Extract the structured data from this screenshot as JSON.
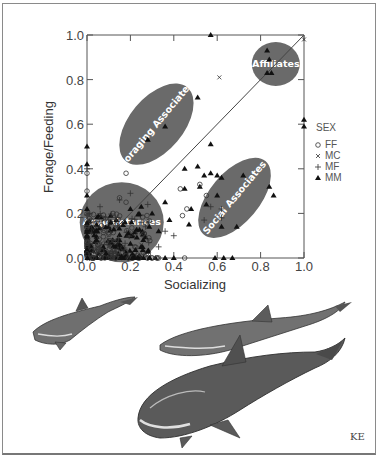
{
  "chart_data": {
    "type": "scatter",
    "title": "",
    "xlabel": "Socializing",
    "ylabel": "Forage/Feeding",
    "xlim": [
      0.0,
      1.0
    ],
    "ylim": [
      0.0,
      1.0
    ],
    "x_ticks": [
      "0.0",
      "0.2",
      "0.4",
      "0.6",
      "0.8",
      "1.0"
    ],
    "y_ticks": [
      "0.0",
      "0.2",
      "0.4",
      "0.6",
      "0.8",
      "1.0"
    ],
    "grid": false,
    "diagonal_reference_line": true,
    "legend": {
      "title": "SEX",
      "position": "right",
      "entries": [
        {
          "symbol": "circle-open",
          "label": "FF"
        },
        {
          "symbol": "x",
          "label": "MC"
        },
        {
          "symbol": "plus",
          "label": "MF"
        },
        {
          "symbol": "triangle-filled",
          "label": "MM"
        }
      ]
    },
    "regions": [
      {
        "label": "Affiliates",
        "center": [
          0.87,
          0.87
        ],
        "shape": "circle"
      },
      {
        "label": "Foraging Associates",
        "center": [
          0.32,
          0.6
        ],
        "shape": "ellipse"
      },
      {
        "label": "Social Associates",
        "center": [
          0.68,
          0.27
        ],
        "shape": "ellipse"
      },
      {
        "label": "Acquaintances",
        "center": [
          0.16,
          0.16
        ],
        "shape": "circle"
      }
    ],
    "series": [
      {
        "name": "MM",
        "points": [
          [
            0.0,
            0.5
          ],
          [
            0.0,
            0.42
          ],
          [
            0.0,
            0.28
          ],
          [
            0.0,
            0.22
          ],
          [
            0.28,
            0.53
          ],
          [
            0.36,
            0.59
          ],
          [
            0.57,
            1.0
          ],
          [
            0.51,
            0.72
          ],
          [
            0.83,
            0.93
          ],
          [
            0.84,
            0.89
          ],
          [
            0.83,
            0.83
          ],
          [
            0.85,
            0.83
          ],
          [
            0.57,
            0.51
          ],
          [
            0.45,
            0.4
          ],
          [
            0.51,
            0.41
          ],
          [
            0.57,
            0.38
          ],
          [
            0.6,
            0.37
          ],
          [
            1.0,
            0.59
          ],
          [
            1.0,
            0.62
          ],
          [
            0.54,
            0.37
          ],
          [
            0.62,
            0.36
          ],
          [
            0.72,
            0.37
          ],
          [
            0.86,
            0.28
          ],
          [
            0.84,
            0.32
          ],
          [
            0.45,
            0.31
          ],
          [
            0.52,
            0.32
          ],
          [
            0.6,
            0.28
          ],
          [
            0.55,
            0.24
          ],
          [
            0.48,
            0.22
          ],
          [
            0.47,
            0.15
          ],
          [
            0.62,
            0.14
          ],
          [
            0.69,
            0.14
          ],
          [
            0.36,
            0.25
          ],
          [
            0.25,
            0.23
          ],
          [
            0.2,
            0.22
          ],
          [
            0.3,
            0.2
          ],
          [
            0.38,
            0.17
          ],
          [
            0.33,
            0.12
          ],
          [
            0.1,
            0.14
          ],
          [
            0.15,
            0.08
          ],
          [
            0.4,
            0.0
          ],
          [
            0.36,
            0.0
          ],
          [
            0.59,
            0.0
          ],
          [
            0.63,
            0.0
          ],
          [
            0.67,
            0.0
          ],
          [
            0.08,
            0.0
          ],
          [
            0.2,
            0.0
          ]
        ]
      },
      {
        "name": "FF",
        "points": [
          [
            0.0,
            0.38
          ],
          [
            0.0,
            0.3
          ],
          [
            0.18,
            0.38
          ],
          [
            0.43,
            0.31
          ],
          [
            0.52,
            0.33
          ],
          [
            0.55,
            0.28
          ],
          [
            0.46,
            0.22
          ],
          [
            0.44,
            0.19
          ],
          [
            0.18,
            0.25
          ],
          [
            0.12,
            0.2
          ],
          [
            0.05,
            0.06
          ],
          [
            0.22,
            0.05
          ],
          [
            0.0,
            0.12
          ],
          [
            0.45,
            0.0
          ],
          [
            0.33,
            0.0
          ],
          [
            0.15,
            0.27
          ]
        ]
      },
      {
        "name": "MC",
        "points": [
          [
            0.61,
            0.81
          ],
          [
            1.0,
            0.98
          ],
          [
            0.05,
            0.12
          ],
          [
            0.25,
            0.06
          ]
        ]
      },
      {
        "name": "MF",
        "points": [
          [
            0.0,
            0.4
          ],
          [
            0.01,
            0.2
          ],
          [
            0.2,
            0.29
          ],
          [
            0.15,
            0.26
          ],
          [
            0.06,
            0.23
          ],
          [
            0.28,
            0.24
          ],
          [
            0.62,
            0.22
          ],
          [
            0.62,
            0.18
          ],
          [
            0.57,
            0.23
          ],
          [
            0.54,
            0.17
          ],
          [
            0.4,
            0.1
          ],
          [
            0.36,
            0.12
          ],
          [
            0.27,
            0.14
          ],
          [
            0.1,
            0.17
          ],
          [
            0.08,
            0.06
          ],
          [
            0.25,
            0.16
          ],
          [
            0.33,
            0.05
          ],
          [
            0.13,
            0.03
          ]
        ]
      }
    ]
  },
  "figure": {
    "signature": "KE",
    "illustration_description": "Pen-and-ink drawing of three bottlenose dolphins swimming"
  }
}
